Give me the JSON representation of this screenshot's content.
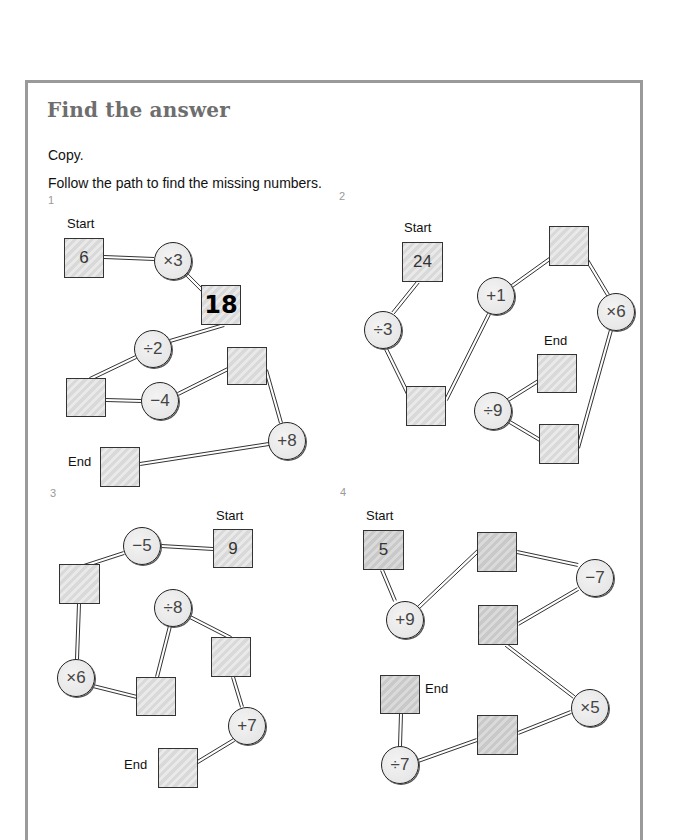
{
  "page": {
    "title": "Find the answer",
    "instructions": [
      "Copy.",
      "Follow the path to find the missing numbers."
    ]
  },
  "colors": {
    "frame": "#9a9a9a",
    "title": "#6e6e6e",
    "box_fill": "#dcdcdc",
    "ink": "#222222"
  },
  "puzzles": [
    {
      "number": "1",
      "number_pos": [
        48,
        194
      ],
      "labels": [
        {
          "text": "Start",
          "x": 67,
          "y": 216
        },
        {
          "text": "End",
          "x": 68,
          "y": 454
        }
      ],
      "nodes": [
        {
          "id": "p1n1",
          "type": "box",
          "value": "6",
          "x": 64,
          "y": 238,
          "w": 40,
          "h": 40
        },
        {
          "id": "p1n2",
          "type": "op",
          "value": "×3",
          "cx": 173,
          "cy": 261,
          "r": 19
        },
        {
          "id": "p1n3",
          "type": "box",
          "value": "18",
          "x": 201,
          "y": 285,
          "w": 40,
          "h": 40,
          "style": "bold"
        },
        {
          "id": "p1n4",
          "type": "op",
          "value": "÷2",
          "cx": 153,
          "cy": 349,
          "r": 19
        },
        {
          "id": "p1n5",
          "type": "box",
          "value": "",
          "x": 66,
          "y": 378,
          "w": 40,
          "h": 39
        },
        {
          "id": "p1n6",
          "type": "op",
          "value": "−4",
          "cx": 160,
          "cy": 401,
          "r": 19
        },
        {
          "id": "p1n7",
          "type": "box",
          "value": "",
          "x": 227,
          "y": 347,
          "w": 40,
          "h": 38
        },
        {
          "id": "p1n8",
          "type": "op",
          "value": "+8",
          "cx": 287,
          "cy": 441,
          "r": 19
        },
        {
          "id": "p1n9",
          "type": "box",
          "value": "",
          "x": 100,
          "y": 447,
          "w": 40,
          "h": 40
        }
      ]
    },
    {
      "number": "2",
      "number_pos": [
        339,
        190
      ],
      "labels": [
        {
          "text": "Start",
          "x": 404,
          "y": 220
        },
        {
          "text": "End",
          "x": 544,
          "y": 333
        }
      ],
      "nodes": [
        {
          "id": "p2n1",
          "type": "box",
          "value": "24",
          "x": 402,
          "y": 242,
          "w": 41,
          "h": 40
        },
        {
          "id": "p2n2",
          "type": "op",
          "value": "÷3",
          "cx": 383,
          "cy": 330,
          "r": 19
        },
        {
          "id": "p2n3",
          "type": "box",
          "value": "",
          "x": 406,
          "y": 386,
          "w": 40,
          "h": 40
        },
        {
          "id": "p2n4",
          "type": "op",
          "value": "+1",
          "cx": 496,
          "cy": 296,
          "r": 19
        },
        {
          "id": "p2n5",
          "type": "box",
          "value": "",
          "x": 549,
          "y": 226,
          "w": 40,
          "h": 40
        },
        {
          "id": "p2n6",
          "type": "op",
          "value": "×6",
          "cx": 616,
          "cy": 312,
          "r": 19
        },
        {
          "id": "p2n7",
          "type": "box",
          "value": "",
          "x": 539,
          "y": 424,
          "w": 40,
          "h": 40
        },
        {
          "id": "p2n8",
          "type": "op",
          "value": "÷9",
          "cx": 493,
          "cy": 411,
          "r": 19
        },
        {
          "id": "p2n9",
          "type": "box",
          "value": "",
          "x": 537,
          "y": 354,
          "w": 40,
          "h": 39
        }
      ]
    },
    {
      "number": "3",
      "number_pos": [
        50,
        487
      ],
      "labels": [
        {
          "text": "Start",
          "x": 216,
          "y": 508
        },
        {
          "text": "End",
          "x": 124,
          "y": 757
        }
      ],
      "nodes": [
        {
          "id": "p3n1",
          "type": "box",
          "value": "9",
          "x": 213,
          "y": 529,
          "w": 40,
          "h": 39
        },
        {
          "id": "p3n2",
          "type": "op",
          "value": "−5",
          "cx": 142,
          "cy": 546,
          "r": 19
        },
        {
          "id": "p3n3",
          "type": "box",
          "value": "",
          "x": 59,
          "y": 564,
          "w": 41,
          "h": 40
        },
        {
          "id": "p3n4",
          "type": "op",
          "value": "×6",
          "cx": 76,
          "cy": 678,
          "r": 19
        },
        {
          "id": "p3n5",
          "type": "box",
          "value": "",
          "x": 136,
          "y": 677,
          "w": 40,
          "h": 39
        },
        {
          "id": "p3n6",
          "type": "op",
          "value": "÷8",
          "cx": 173,
          "cy": 608,
          "r": 19
        },
        {
          "id": "p3n7",
          "type": "box",
          "value": "",
          "x": 211,
          "y": 637,
          "w": 40,
          "h": 40
        },
        {
          "id": "p3n8",
          "type": "op",
          "value": "+7",
          "cx": 247,
          "cy": 726,
          "r": 19
        },
        {
          "id": "p3n9",
          "type": "box",
          "value": "",
          "x": 158,
          "y": 748,
          "w": 40,
          "h": 40
        }
      ]
    },
    {
      "number": "4",
      "number_pos": [
        340,
        486
      ],
      "labels": [
        {
          "text": "Start",
          "x": 366,
          "y": 508
        },
        {
          "text": "End",
          "x": 425,
          "y": 681
        }
      ],
      "nodes": [
        {
          "id": "p4n1",
          "type": "box",
          "value": "5",
          "x": 363,
          "y": 530,
          "w": 41,
          "h": 40,
          "style": "dark"
        },
        {
          "id": "p4n2",
          "type": "op",
          "value": "+9",
          "cx": 405,
          "cy": 620,
          "r": 19
        },
        {
          "id": "p4n3",
          "type": "box",
          "value": "",
          "x": 477,
          "y": 532,
          "w": 40,
          "h": 40,
          "style": "dark"
        },
        {
          "id": "p4n4",
          "type": "op",
          "value": "−7",
          "cx": 595,
          "cy": 578,
          "r": 19
        },
        {
          "id": "p4n5",
          "type": "box",
          "value": "",
          "x": 478,
          "y": 605,
          "w": 40,
          "h": 40,
          "style": "dark"
        },
        {
          "id": "p4n6",
          "type": "op",
          "value": "×5",
          "cx": 590,
          "cy": 708,
          "r": 19
        },
        {
          "id": "p4n7",
          "type": "box",
          "value": "",
          "x": 477,
          "y": 715,
          "w": 41,
          "h": 40,
          "style": "dark"
        },
        {
          "id": "p4n8",
          "type": "op",
          "value": "÷7",
          "cx": 400,
          "cy": 765,
          "r": 19
        },
        {
          "id": "p4n9",
          "type": "box",
          "value": "",
          "x": 380,
          "y": 675,
          "w": 40,
          "h": 39,
          "style": "dark"
        }
      ]
    }
  ],
  "edges": [
    [
      [
        104,
        257
      ],
      [
        154,
        259
      ]
    ],
    [
      [
        186,
        274
      ],
      [
        213,
        301
      ]
    ],
    [
      [
        224,
        325
      ],
      [
        170,
        341
      ]
    ],
    [
      [
        136,
        357
      ],
      [
        90,
        379
      ]
    ],
    [
      [
        106,
        400
      ],
      [
        141,
        401
      ]
    ],
    [
      [
        178,
        394
      ],
      [
        228,
        369
      ]
    ],
    [
      [
        266,
        370
      ],
      [
        281,
        423
      ]
    ],
    [
      [
        269,
        444
      ],
      [
        140,
        464
      ]
    ],
    [
      [
        418,
        282
      ],
      [
        393,
        313
      ]
    ],
    [
      [
        386,
        349
      ],
      [
        410,
        398
      ]
    ],
    [
      [
        446,
        400
      ],
      [
        489,
        314
      ]
    ],
    [
      [
        512,
        286
      ],
      [
        551,
        258
      ]
    ],
    [
      [
        587,
        260
      ],
      [
        608,
        295
      ]
    ],
    [
      [
        611,
        330
      ],
      [
        578,
        448
      ]
    ],
    [
      [
        540,
        440
      ],
      [
        508,
        421
      ]
    ],
    [
      [
        508,
        400
      ],
      [
        540,
        380
      ]
    ],
    [
      [
        213,
        549
      ],
      [
        161,
        546
      ]
    ],
    [
      [
        124,
        553
      ],
      [
        84,
        566
      ]
    ],
    [
      [
        79,
        604
      ],
      [
        77,
        659
      ]
    ],
    [
      [
        93,
        686
      ],
      [
        137,
        697
      ]
    ],
    [
      [
        157,
        677
      ],
      [
        170,
        626
      ]
    ],
    [
      [
        190,
        617
      ],
      [
        231,
        638
      ]
    ],
    [
      [
        233,
        677
      ],
      [
        242,
        707
      ]
    ],
    [
      [
        234,
        740
      ],
      [
        196,
        763
      ]
    ],
    [
      [
        382,
        570
      ],
      [
        395,
        601
      ]
    ],
    [
      [
        419,
        607
      ],
      [
        478,
        551
      ]
    ],
    [
      [
        517,
        552
      ],
      [
        578,
        565
      ]
    ],
    [
      [
        578,
        589
      ],
      [
        518,
        624
      ]
    ],
    [
      [
        506,
        645
      ],
      [
        574,
        697
      ]
    ],
    [
      [
        571,
        712
      ],
      [
        518,
        733
      ]
    ],
    [
      [
        477,
        740
      ],
      [
        418,
        761
      ]
    ],
    [
      [
        400,
        746
      ],
      [
        401,
        714
      ]
    ]
  ]
}
